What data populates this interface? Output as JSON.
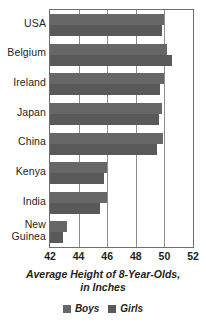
{
  "chart_data": {
    "type": "bar",
    "orientation": "horizontal",
    "title": "",
    "xlabel": "Average Height of 8-Year-Olds, in Inches",
    "ylabel": "",
    "xlim": [
      42,
      52
    ],
    "xticks": [
      42,
      44,
      46,
      48,
      50,
      52
    ],
    "grid": true,
    "legend_position": "bottom",
    "categories": [
      "USA",
      "Belgium",
      "Ireland",
      "Japan",
      "China",
      "Kenya",
      "India",
      "New Guinea"
    ],
    "series": [
      {
        "name": "Boys",
        "color": "#676767",
        "values": [
          50.0,
          50.2,
          50.0,
          49.8,
          49.9,
          46.0,
          46.0,
          43.2
        ]
      },
      {
        "name": "Girls",
        "color": "#595959",
        "values": [
          49.8,
          50.5,
          49.7,
          49.6,
          49.5,
          45.8,
          45.5,
          42.9
        ]
      }
    ]
  },
  "axis": {
    "title_line1": "Average Height of 8-Year-Olds,",
    "title_line2": "in Inches",
    "tick_labels": [
      "42",
      "44",
      "46",
      "48",
      "50",
      "52"
    ]
  },
  "category_labels": [
    {
      "line1": "USA",
      "line2": ""
    },
    {
      "line1": "Belgium",
      "line2": ""
    },
    {
      "line1": "Ireland",
      "line2": ""
    },
    {
      "line1": "Japan",
      "line2": ""
    },
    {
      "line1": "China",
      "line2": ""
    },
    {
      "line1": "Kenya",
      "line2": ""
    },
    {
      "line1": "India",
      "line2": ""
    },
    {
      "line1": "New",
      "line2": "Guinea"
    }
  ],
  "legend": {
    "items": [
      {
        "label": "Boys",
        "color": "#676767"
      },
      {
        "label": "Girls",
        "color": "#595959"
      }
    ]
  }
}
